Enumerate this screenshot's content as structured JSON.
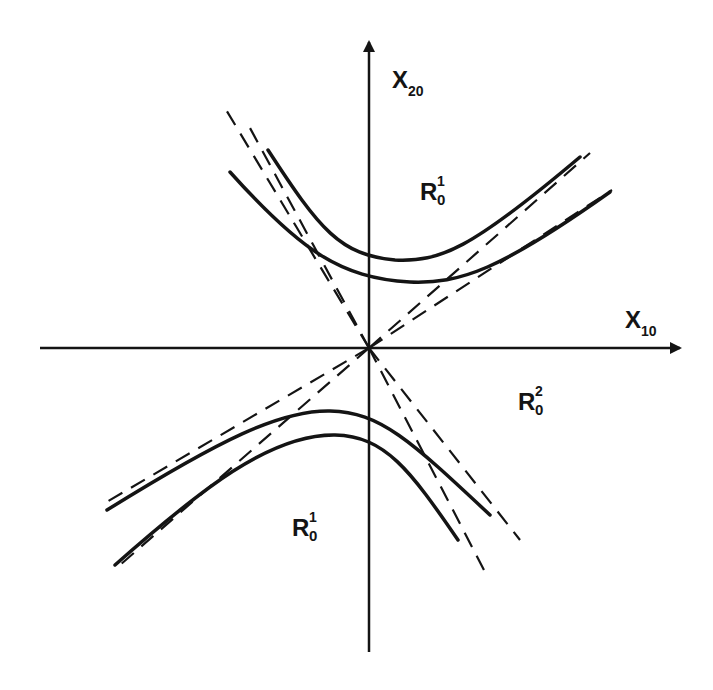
{
  "diagram": {
    "type": "hyperbola-regions",
    "axes": {
      "x": {
        "label_main": "X",
        "label_sub": "10"
      },
      "y": {
        "label_main": "X",
        "label_sub": "20"
      }
    },
    "regions": [
      {
        "id": "upper",
        "label_main": "R",
        "label_sub": "0",
        "label_sup": "1"
      },
      {
        "id": "right",
        "label_main": "R",
        "label_sub": "0",
        "label_sup": "2"
      },
      {
        "id": "lower",
        "label_main": "R",
        "label_sub": "0",
        "label_sup": "1"
      }
    ],
    "curves": {
      "upper_branches": 2,
      "lower_branches": 2,
      "asymptotes_dashed": 4
    },
    "colors": {
      "ink": "#141414",
      "background": "#ffffff"
    }
  }
}
